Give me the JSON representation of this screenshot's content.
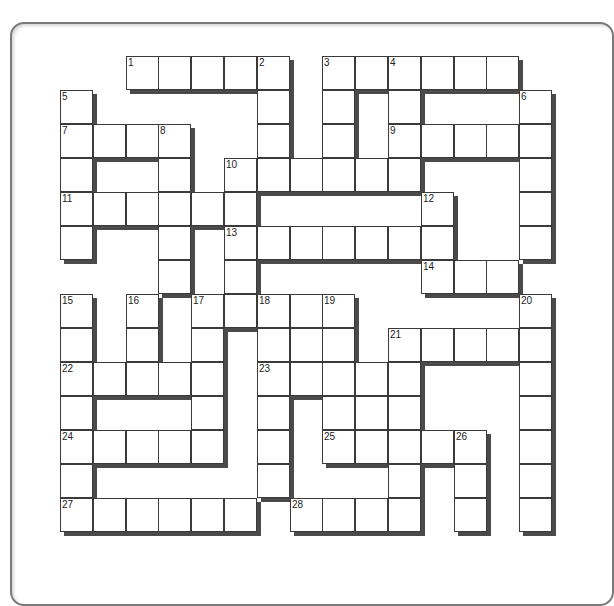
{
  "puzzle": {
    "origin": {
      "x": 60,
      "y": 56
    },
    "cell_w": 32.8,
    "cell_h": 34,
    "rows": [
      [
        2,
        3,
        4,
        5,
        6,
        8,
        9,
        10,
        11,
        12,
        13
      ],
      [
        0,
        6,
        8,
        10,
        14
      ],
      [
        0,
        1,
        2,
        3,
        6,
        8,
        10,
        11,
        12,
        13,
        14
      ],
      [
        0,
        3,
        5,
        6,
        7,
        8,
        9,
        10,
        14
      ],
      [
        0,
        1,
        2,
        3,
        4,
        5,
        11,
        14
      ],
      [
        0,
        3,
        5,
        6,
        7,
        8,
        9,
        10,
        11,
        14
      ],
      [
        3,
        5,
        11,
        12,
        13
      ],
      [
        0,
        2,
        4,
        5,
        6,
        7,
        8,
        14
      ],
      [
        0,
        2,
        4,
        6,
        7,
        8,
        10,
        11,
        12,
        13,
        14
      ],
      [
        0,
        1,
        2,
        3,
        4,
        6,
        7,
        8,
        9,
        10,
        14
      ],
      [
        0,
        4,
        6,
        8,
        9,
        10,
        14
      ],
      [
        0,
        1,
        2,
        3,
        4,
        6,
        8,
        9,
        10,
        11,
        12,
        14
      ],
      [
        0,
        6,
        10,
        12,
        14
      ],
      [
        0,
        1,
        2,
        3,
        4,
        5,
        7,
        8,
        9,
        10,
        12,
        14
      ]
    ],
    "numbers": [
      {
        "n": "1",
        "r": 0,
        "c": 2
      },
      {
        "n": "2",
        "r": 0,
        "c": 6
      },
      {
        "n": "3",
        "r": 0,
        "c": 8
      },
      {
        "n": "4",
        "r": 0,
        "c": 10
      },
      {
        "n": "5",
        "r": 1,
        "c": 0
      },
      {
        "n": "6",
        "r": 1,
        "c": 14
      },
      {
        "n": "7",
        "r": 2,
        "c": 0
      },
      {
        "n": "8",
        "r": 2,
        "c": 3
      },
      {
        "n": "9",
        "r": 2,
        "c": 10
      },
      {
        "n": "10",
        "r": 3,
        "c": 5
      },
      {
        "n": "11",
        "r": 4,
        "c": 0
      },
      {
        "n": "12",
        "r": 4,
        "c": 11
      },
      {
        "n": "13",
        "r": 5,
        "c": 5
      },
      {
        "n": "14",
        "r": 6,
        "c": 11
      },
      {
        "n": "15",
        "r": 7,
        "c": 0
      },
      {
        "n": "16",
        "r": 7,
        "c": 2
      },
      {
        "n": "17",
        "r": 7,
        "c": 4
      },
      {
        "n": "18",
        "r": 7,
        "c": 6
      },
      {
        "n": "19",
        "r": 7,
        "c": 8
      },
      {
        "n": "20",
        "r": 7,
        "c": 14
      },
      {
        "n": "21",
        "r": 8,
        "c": 10
      },
      {
        "n": "22",
        "r": 9,
        "c": 0
      },
      {
        "n": "23",
        "r": 9,
        "c": 6
      },
      {
        "n": "24",
        "r": 11,
        "c": 0
      },
      {
        "n": "25",
        "r": 11,
        "c": 8
      },
      {
        "n": "26",
        "r": 11,
        "c": 12
      },
      {
        "n": "27",
        "r": 13,
        "c": 0
      },
      {
        "n": "28",
        "r": 13,
        "c": 7
      }
    ],
    "colors": {
      "cell_border": "#3a3a3a",
      "shadow": "#4a4a4a",
      "card_border": "#7a7a7a",
      "background": "#ffffff"
    }
  }
}
